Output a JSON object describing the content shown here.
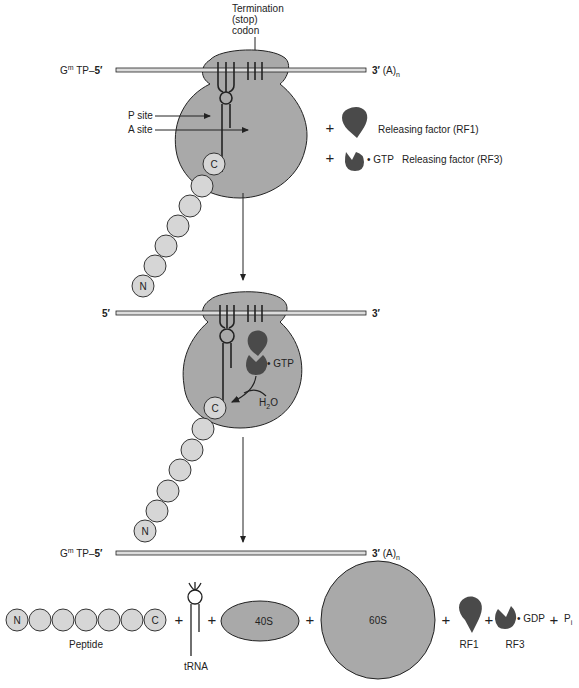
{
  "colors": {
    "ribosome": "#a9a9a9",
    "factor": "#4a4a4a",
    "amino_acid": "#d6d6d6",
    "mrna": "#d9d9d9",
    "stroke": "#222222"
  },
  "panel1": {
    "termination_label": [
      "Termination",
      "(stop)",
      "codon"
    ],
    "mrna_left": "G",
    "mrna_left_sup": "m",
    "mrna_left_rest": " TP–",
    "mrna_left_5": "5′",
    "mrna_right_3": "3′",
    "mrna_right_tail": " (A)",
    "mrna_right_sub": "n",
    "p_site": "P site",
    "a_site": "A site",
    "c_terminus": "C",
    "n_terminus": "N",
    "plus": "+",
    "rf1_label": "Releasing factor (RF1)",
    "rf3_gtp": "• GTP",
    "rf3_label": "Releasing factor (RF3)"
  },
  "panel2": {
    "mrna_left_5": "5′",
    "mrna_right_3": "3′",
    "gtp": "• GTP",
    "water": "H",
    "water_sub": "2",
    "water_o": "O",
    "c_terminus": "C",
    "n_terminus": "N"
  },
  "panel3": {
    "mrna_left": "G",
    "mrna_left_sup": "m",
    "mrna_left_rest": " TP–",
    "mrna_left_5": "5′",
    "mrna_right_3": "3′",
    "mrna_right_tail": " (A)",
    "mrna_right_sub": "n",
    "peptide_n": "N",
    "peptide_c": "C",
    "peptide_label": "Peptide",
    "trna_label": "tRNA",
    "small_subunit": "40S",
    "large_subunit": "60S",
    "rf1_label": "RF1",
    "rf3_label": "RF3",
    "gdp": "• GDP",
    "pi": "P",
    "pi_sub": "i",
    "plus": "+"
  }
}
